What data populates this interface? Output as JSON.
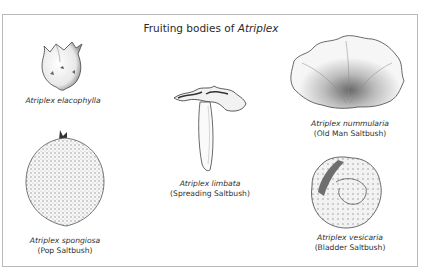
{
  "figure": {
    "title_prefix": "Fruiting bodies of ",
    "title_genus": "Atriplex",
    "border_color": "#b9b9b9",
    "ink_color": "#2a2a2a"
  },
  "specimens": [
    {
      "scientific_name": "Atriplex elacophylla",
      "common_name": ""
    },
    {
      "scientific_name": "Atriplex spongiosa",
      "common_name": "(Pop Saltbush)"
    },
    {
      "scientific_name": "Atriplex limbata",
      "common_name": "(Spreading Saltbush)"
    },
    {
      "scientific_name": "Atriplex nummularia",
      "common_name": "(Old Man Saltbush)"
    },
    {
      "scientific_name": "Atriplex vesicaria",
      "common_name": "(Bladder Saltbush)"
    }
  ]
}
